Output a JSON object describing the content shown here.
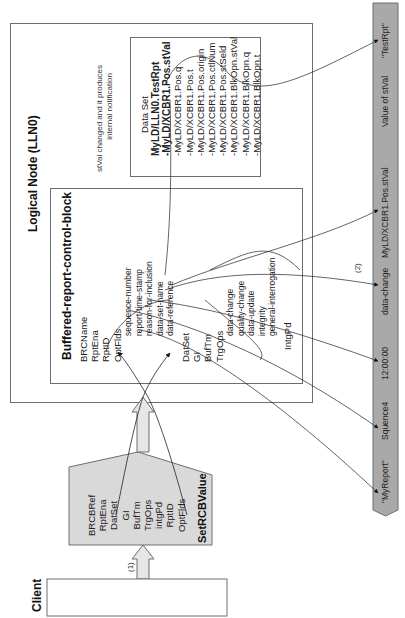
{
  "client": {
    "label": "Client"
  },
  "step1": {
    "label": "(1)"
  },
  "step2": {
    "label": "(2)"
  },
  "set_rcb_value": {
    "title": "SetRCBValue",
    "fields": [
      "BRCBRef",
      "RptEna",
      "DatSet",
      "GI",
      "BufTm",
      "TrgOps",
      "intgPd",
      "RptID",
      "OptFlds"
    ]
  },
  "logical_node": {
    "title": "Logical Node (LLN0)"
  },
  "brcb": {
    "title": "Buffered-report-control-block",
    "fields_top": [
      "BRCName",
      "RptEna",
      "RptID",
      "OptFlds"
    ],
    "optflds_items": [
      "sequence-number",
      "report-time-stamp",
      "reason-for-inclusion",
      "data-set-name",
      "data-reference"
    ],
    "fields_mid": [
      "DatSet",
      "GI",
      "BufTm",
      "TrgOps"
    ],
    "trgops_items": [
      "data-change",
      "quality-change",
      "data-update",
      "integrity",
      "general-interrogation"
    ],
    "fields_bottom": [
      "IntgPd"
    ]
  },
  "notification": {
    "line1": "stVal changed and it produces",
    "line2": "internal notification"
  },
  "data_set": {
    "title": "Data Set",
    "name": "MyLD/LLN0.TestRpt",
    "members": [
      "-MyLD/XCBR1.Pos.stVal",
      "-MyLD/XCBR1.Pos.q",
      "-MyLD/XCBR1.Pos.t",
      "-MyLD/XCBR1.Pos.origin",
      "-MyLD/XCBR1.Pos.ctlNum",
      "-MyLD/XCBR1.Pos.stSeld",
      "-MyLD/XCBR1.BlkOpn.stVal",
      "-MyLD/XCBR1.BlkOpn.q",
      "-MyLD/XCBR1.BlkOpn.t"
    ]
  },
  "report": {
    "fields": [
      "\"MyReport\"",
      "Squence4",
      "12:00:00",
      "data-change",
      "MyLD/XCBR1.Pos.stVal",
      "Value of stVal",
      "\"TestRpt\""
    ]
  },
  "colors": {
    "box_border": "#6e6e6e",
    "shaded_fill": "#d9d9d9",
    "report_bar_fill": "#a9a9a9",
    "arrow_fill": "#d9d9d9",
    "line": "#333333"
  }
}
